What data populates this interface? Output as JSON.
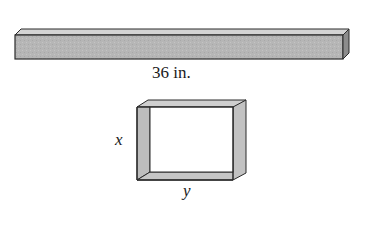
{
  "diagram": {
    "bar": {
      "length_label": "36 in.",
      "fill_color": "#b4b4b4",
      "top_color": "#d2d2d2",
      "end_color": "#8a8a8a",
      "edge_color": "#2a2a2a"
    },
    "frame": {
      "side_label": "x",
      "bottom_label": "y",
      "fill_color": "#bdbdbd",
      "edge_color": "#2a2a2a"
    }
  }
}
